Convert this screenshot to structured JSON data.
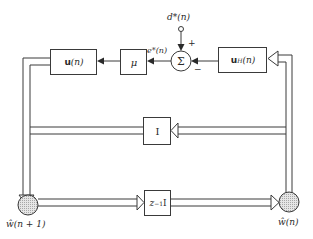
{
  "diagram": {
    "type": "block-diagram",
    "blocks": {
      "input_vector": {
        "bold": "u",
        "arg": "(n)"
      },
      "step_size": {
        "label": "μ"
      },
      "hermitian_input": {
        "bold": "u",
        "sup": "H",
        "arg": "(n)"
      },
      "identity": {
        "label": "I"
      },
      "delay": {
        "label": "z",
        "sup": "−1",
        "suffix": "I"
      },
      "summer": {
        "label": "Σ"
      }
    },
    "signals": {
      "desired": "d*(n)",
      "error": "e*(n)",
      "plus_sign": "+",
      "minus_sign": "−",
      "weight_next": "ŵ(n + 1)",
      "weight_current": "ŵ(n)"
    },
    "colors": {
      "line": "#3a3a3a",
      "node_fill": "#d9d9d9"
    }
  }
}
